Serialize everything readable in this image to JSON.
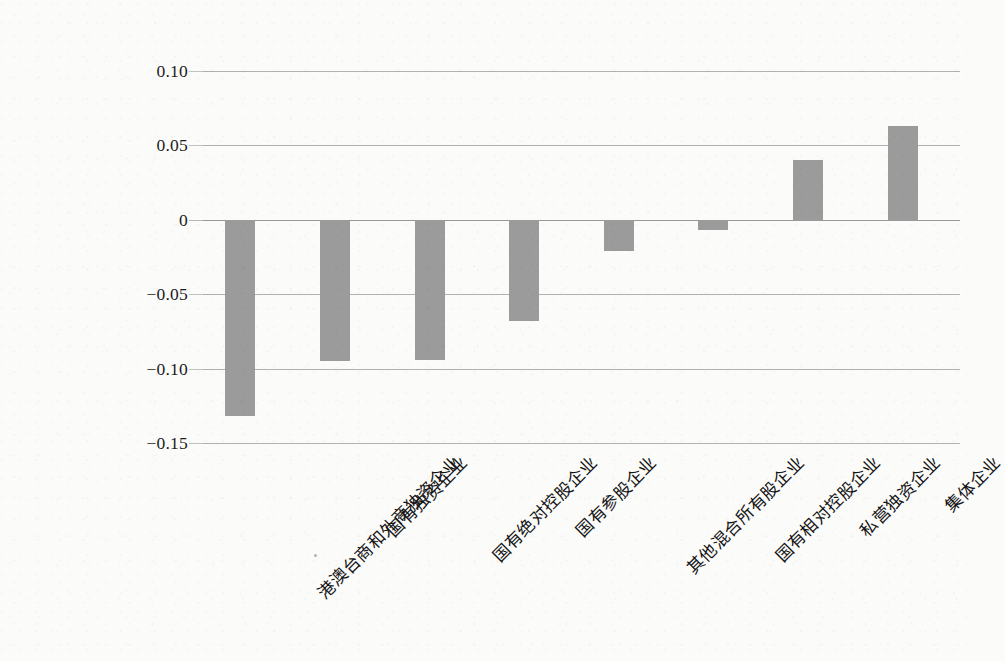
{
  "chart_data": {
    "type": "bar",
    "title": "",
    "subtitle": "",
    "xlabel": "",
    "ylabel": "",
    "categories": [
      "港澳台商和外商独资企业",
      "国有独资企业",
      "国有绝对控股企业",
      "国有参股企业",
      "其他混合所有股企业",
      "国有相对控股企业",
      "私营独资企业",
      "集体企业"
    ],
    "values": [
      -0.132,
      -0.095,
      -0.094,
      -0.068,
      -0.021,
      -0.007,
      0.04,
      0.063
    ],
    "ylim": [
      -0.15,
      0.1
    ],
    "yticks": [
      0.1,
      0.05,
      0,
      -0.05,
      -0.1,
      -0.15
    ],
    "ytick_labels": [
      "0.10",
      "0.05",
      "0",
      "−0.05",
      "−0.10",
      "−0.15"
    ],
    "grid": true,
    "legend": "none",
    "bar_color": "#9b9b9b",
    "gridline_color": "#9c9c9c",
    "background_color": "#fbfbfa",
    "x_label_rotation_deg": -45
  }
}
